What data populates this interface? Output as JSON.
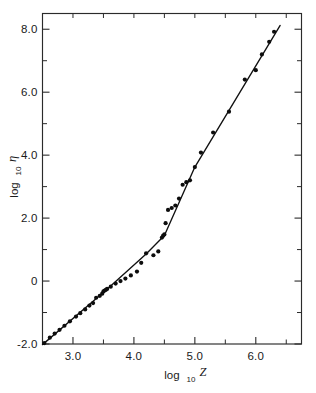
{
  "figure": {
    "background_color": "#ffffff",
    "ink_color": "#111111"
  },
  "chart_data": {
    "type": "scatter",
    "title": "",
    "subtitle": "",
    "xlabel": "log10 Z",
    "ylabel": "log10 eta",
    "xlabel_parts": {
      "base": "log",
      "subscript": "10",
      "variable": "Z"
    },
    "ylabel_parts": {
      "base": "log",
      "subscript": "10",
      "variable": "η"
    },
    "xlim": [
      2.5,
      6.75
    ],
    "ylim": [
      -2.0,
      8.5
    ],
    "grid": false,
    "legend": null,
    "legend_position": "none",
    "xticks_major": [
      3.0,
      4.0,
      5.0,
      6.0
    ],
    "xticklabels_major": [
      "3.0",
      "4.0",
      "5.0",
      "6.0"
    ],
    "xticks_minor": [
      2.5,
      3.5,
      4.5,
      5.5,
      6.5
    ],
    "yticks_major": [
      -2.0,
      0,
      2.0,
      4.0,
      6.0,
      8.0
    ],
    "yticklabels_major": [
      "-2.0",
      "0",
      "2.0",
      "4.0",
      "6.0",
      "8.0"
    ],
    "yticks_minor": [
      -1.0,
      1.0,
      3.0,
      5.0,
      7.0
    ],
    "tick_direction": "in",
    "frame": "box",
    "series": [
      {
        "name": "data",
        "marker": "filled-circle",
        "marker_size": 4.2,
        "line": true,
        "x": [
          2.53,
          2.62,
          2.7,
          2.78,
          2.86,
          2.95,
          3.05,
          3.12,
          3.2,
          3.27,
          3.33,
          3.38,
          3.44,
          3.48,
          3.5,
          3.52,
          3.54,
          3.56,
          3.62,
          3.7,
          3.78,
          3.86,
          3.95,
          4.05,
          4.12,
          4.2,
          4.32,
          4.4,
          4.46,
          4.48,
          4.5,
          4.52,
          4.56,
          4.62,
          4.68,
          4.74,
          4.8,
          4.86,
          4.92,
          5.0,
          5.1,
          5.3,
          5.56,
          5.82,
          6.0,
          6.1,
          6.22,
          6.3
        ],
        "y": [
          -1.97,
          -1.8,
          -1.67,
          -1.55,
          -1.42,
          -1.28,
          -1.13,
          -1.02,
          -0.9,
          -0.78,
          -0.7,
          -0.53,
          -0.47,
          -0.4,
          -0.33,
          -0.3,
          -0.28,
          -0.25,
          -0.18,
          -0.08,
          0.0,
          0.08,
          0.18,
          0.3,
          0.58,
          0.88,
          0.82,
          0.94,
          1.38,
          1.44,
          1.48,
          1.84,
          2.26,
          2.32,
          2.4,
          2.62,
          3.06,
          3.14,
          3.2,
          3.62,
          4.08,
          4.72,
          5.38,
          6.4,
          6.7,
          7.2,
          7.6,
          7.92
        ]
      }
    ],
    "fit_line": {
      "description": "piecewise trend through points",
      "breakpoints_x": [
        2.5,
        3.55,
        4.2,
        4.5,
        5.0,
        6.4
      ],
      "breakpoints_y": [
        -2.02,
        -0.28,
        0.86,
        1.45,
        3.62,
        8.12
      ]
    }
  }
}
